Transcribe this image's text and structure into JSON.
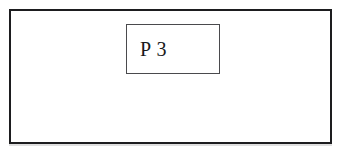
{
  "figure": {
    "type": "block-diagram",
    "background_color": "#ffffff",
    "outer_frame": {
      "name": "outer-boundary-rectangle",
      "border_color": "#1d1d1f",
      "fill_color": "#ffffff",
      "label": ""
    },
    "blocks": [
      {
        "id": "p3",
        "label": "P 3",
        "border_color": "#4a4a4d",
        "fill_color": "#ffffff",
        "text_color": "#19191b"
      }
    ]
  }
}
